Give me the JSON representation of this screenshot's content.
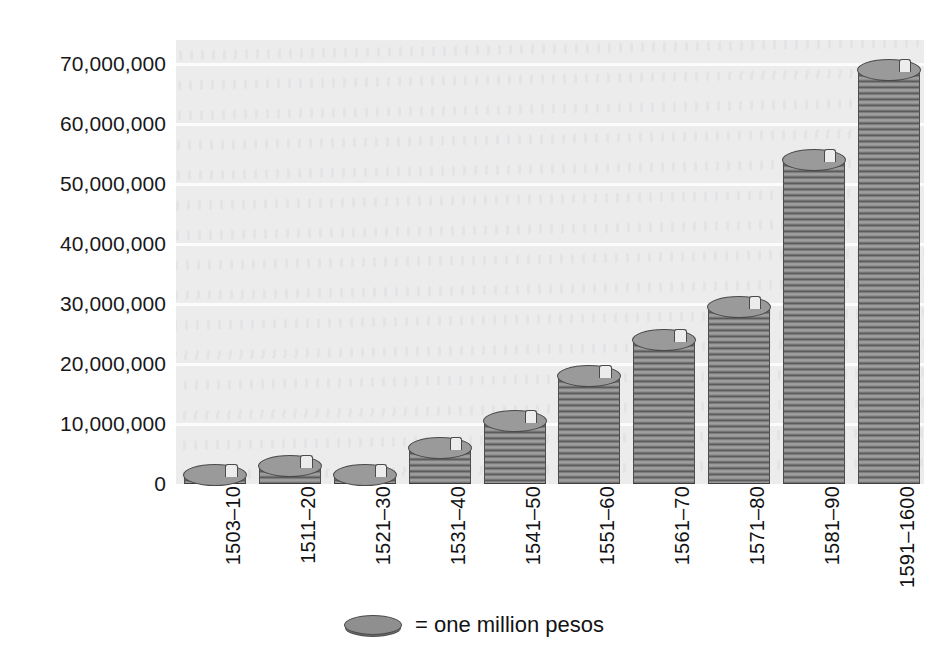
{
  "chart_data": {
    "type": "bar",
    "title": "",
    "xlabel": "",
    "ylabel": "",
    "categories": [
      "1503–10",
      "1511–20",
      "1521–30",
      "1531–40",
      "1541–50",
      "1551–60",
      "1561–70",
      "1571–80",
      "1581–90",
      "1591–1600"
    ],
    "values": [
      1500000,
      3000000,
      1500000,
      6000000,
      10500000,
      18000000,
      24000000,
      29500000,
      54000000,
      69000000
    ],
    "ylim": [
      0,
      74000000
    ],
    "ytick_labels": [
      "0",
      "10,000,000",
      "20,000,000",
      "30,000,000",
      "40,000,000",
      "50,000,000",
      "60,000,000",
      "70,000,000"
    ],
    "ytick_values": [
      0,
      10000000,
      20000000,
      30000000,
      40000000,
      50000000,
      60000000,
      70000000
    ],
    "grid": true,
    "legend_position": "bottom",
    "legend": [
      {
        "marker": "coin-icon",
        "label": "= one million pesos"
      }
    ],
    "unit_note": "Each coin in a stack represents one million pesos",
    "colors": {
      "coin": "#8f8f8f",
      "coin_edge": "#4a4a4a",
      "plot_background": "#ececed",
      "gridline": "#fcfcfc",
      "text": "#131315",
      "page_background": "#ffffff"
    }
  }
}
